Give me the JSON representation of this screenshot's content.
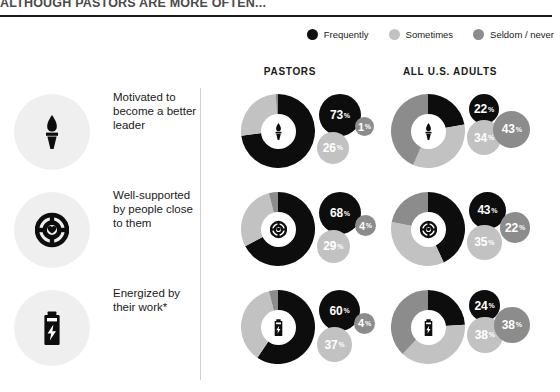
{
  "title": "ALTHOUGH PASTORS ARE MORE OFTEN...",
  "legend": [
    {
      "label": "Frequently",
      "color": "#0d0d0d",
      "key": "frequently"
    },
    {
      "label": "Sometimes",
      "color": "#c2c2c2",
      "key": "sometimes"
    },
    {
      "label": "Seldom / never",
      "color": "#8c8c8c",
      "key": "seldom_never"
    }
  ],
  "columns": [
    {
      "id": "pastors",
      "label": "PASTORS"
    },
    {
      "id": "adults",
      "label": "ALL U.S. ADULTS"
    }
  ],
  "rows": [
    {
      "label": "Motivated to become a better leader",
      "icon": "torch-icon",
      "pastors": {
        "frequently": 73,
        "sometimes": 26,
        "seldom_never": 1
      },
      "adults": {
        "frequently": 22,
        "sometimes": 34,
        "seldom_never": 43
      }
    },
    {
      "label": "Well-supported by people close to them",
      "icon": "lifebuoy-heart-icon",
      "pastors": {
        "frequently": 68,
        "sometimes": 29,
        "seldom_never": 4
      },
      "adults": {
        "frequently": 43,
        "sometimes": 35,
        "seldom_never": 22
      }
    },
    {
      "label": "Energized by their work*",
      "icon": "battery-bolt-icon",
      "pastors": {
        "frequently": 60,
        "sometimes": 37,
        "seldom_never": 4
      },
      "adults": {
        "frequently": 24,
        "sometimes": 38,
        "seldom_never": 38
      }
    }
  ],
  "percent_symbol": "%",
  "chart_data": {
    "type": "pie",
    "title": "ALTHOUGH PASTORS ARE MORE OFTEN...",
    "categories": [
      "Frequently",
      "Sometimes",
      "Seldom / never"
    ],
    "colors": [
      "#0d0d0d",
      "#c2c2c2",
      "#8c8c8c"
    ],
    "units": "percent",
    "groups": [
      "PASTORS",
      "ALL U.S. ADULTS"
    ],
    "charts": [
      {
        "row": "Motivated to become a better leader",
        "group": "PASTORS",
        "values": [
          73,
          26,
          1
        ]
      },
      {
        "row": "Motivated to become a better leader",
        "group": "ALL U.S. ADULTS",
        "values": [
          22,
          34,
          43
        ]
      },
      {
        "row": "Well-supported by people close to them",
        "group": "PASTORS",
        "values": [
          68,
          29,
          4
        ]
      },
      {
        "row": "Well-supported by people close to them",
        "group": "ALL U.S. ADULTS",
        "values": [
          43,
          35,
          22
        ]
      },
      {
        "row": "Energized by their work*",
        "group": "PASTORS",
        "values": [
          60,
          37,
          4
        ]
      },
      {
        "row": "Energized by their work*",
        "group": "ALL U.S. ADULTS",
        "values": [
          24,
          38,
          38
        ]
      }
    ],
    "legend_position": "top-right",
    "grid": false
  }
}
